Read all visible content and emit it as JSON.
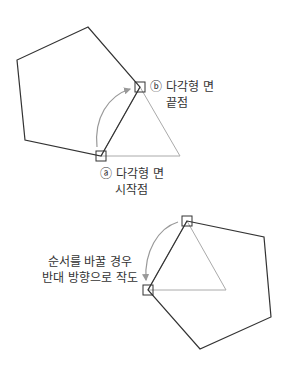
{
  "diagram": {
    "top": {
      "label_b_line1": "ⓑ 다각형 면",
      "label_b_line2": "끝점",
      "label_a_line1": "ⓐ 다각형 면",
      "label_a_line2": "시작점"
    },
    "bottom": {
      "note_line1": "순서를 바꿀 경우",
      "note_line2": "반대 방향으로 작도"
    },
    "colors": {
      "polygon_stroke": "#333333",
      "helper_stroke": "#aaaaaa",
      "arrow_stroke": "#999999"
    }
  }
}
